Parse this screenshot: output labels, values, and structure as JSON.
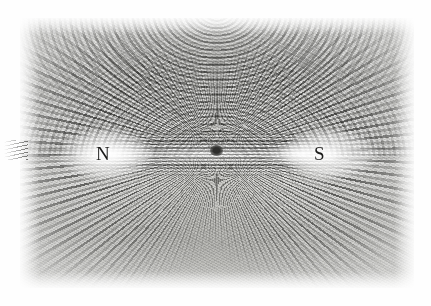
{
  "figure": {
    "medium": "grayscale photograph",
    "caption": "",
    "background_color": "#ffffff",
    "plate_color": "#b4b4b0",
    "ink_color": "#1b1b1a"
  },
  "plate": {
    "x": 20,
    "y": 18,
    "width": 394,
    "height": 270
  },
  "magnet": {
    "north_pole_label": "N",
    "south_pole_label": "S",
    "north_pole_x": 103,
    "south_pole_x": 320,
    "axis_y": 152,
    "body_left": 76,
    "body_right": 336,
    "center_marker": "dark speck at magnet midpoint"
  },
  "field": {
    "pattern": "dipole",
    "upper_lobe": "concentric arcs from N over the top to S",
    "lower_lobe": "concentric arcs from N under the bottom to S",
    "pole_pattern": "radial spray diverging outward at each pole",
    "axial_pattern": "straight filings aligned along the magnet axis"
  },
  "labels": [
    {
      "text": "N",
      "name": "north-pole-label",
      "x": 103,
      "y": 152
    },
    {
      "text": "S",
      "name": "south-pole-label",
      "x": 320,
      "y": 152
    }
  ],
  "chart_data": {
    "type": "scatter",
    "xlabel": "",
    "ylabel": "",
    "annotations": [
      "N",
      "S"
    ],
    "series": [
      {
        "name": "north-pole",
        "x": [
          103
        ],
        "y": [
          152
        ]
      },
      {
        "name": "south-pole",
        "x": [
          320
        ],
        "y": [
          152
        ]
      },
      {
        "name": "center-speck",
        "x": [
          215
        ],
        "y": [
          152
        ]
      }
    ]
  }
}
